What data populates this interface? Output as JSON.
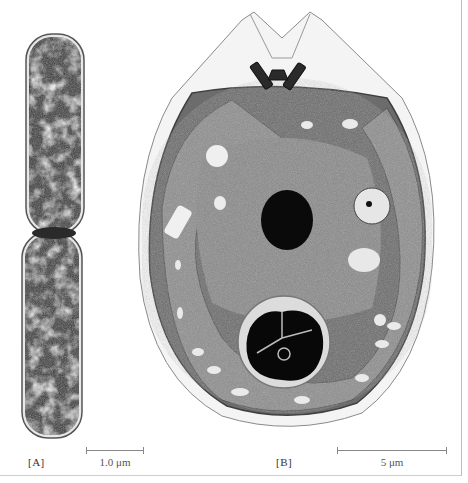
{
  "figure": {
    "panels": [
      {
        "id": "A",
        "label": "[A]",
        "subject": "rod-shaped bacterial cells dividing (electron micrograph)",
        "scale_bar": {
          "text": "1.0 μm"
        }
      },
      {
        "id": "B",
        "label": "[B]",
        "subject": "eukaryotic algal cell with nucleus, chloroplasts, pyrenoid, flagellar bases (electron micrograph)",
        "scale_bar": {
          "text": "5 μm"
        }
      }
    ],
    "colors": {
      "background": "#ffffff",
      "border": "#bdbdbd",
      "label_text": "#333333",
      "scale_bar": "#888888"
    }
  }
}
